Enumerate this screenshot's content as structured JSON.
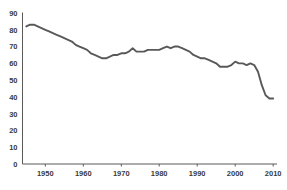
{
  "chart_data": {
    "type": "line",
    "title": "",
    "xlabel": "",
    "ylabel": "",
    "xlim": [
      1944,
      2011
    ],
    "ylim": [
      0,
      90
    ],
    "grid": false,
    "legend": null,
    "ytick_labels": [
      "90",
      "80",
      "70",
      "60",
      "50",
      "40",
      "30",
      "20",
      "10",
      "0"
    ],
    "yticks": [
      90,
      80,
      70,
      60,
      50,
      40,
      30,
      20,
      10,
      0
    ],
    "xtick_labels": [
      "1950",
      "1960",
      "1970",
      "1980",
      "1990",
      "2000",
      "2010"
    ],
    "xticks": [
      1950,
      1960,
      1970,
      1980,
      1990,
      2000,
      2010
    ],
    "series": [
      {
        "name": "series-1",
        "color": "#595959",
        "x": [
          1945,
          1946,
          1947,
          1948,
          1949,
          1950,
          1951,
          1952,
          1953,
          1954,
          1955,
          1956,
          1957,
          1958,
          1959,
          1960,
          1961,
          1962,
          1963,
          1964,
          1965,
          1966,
          1967,
          1968,
          1969,
          1970,
          1971,
          1972,
          1973,
          1974,
          1975,
          1976,
          1977,
          1978,
          1979,
          1980,
          1981,
          1982,
          1983,
          1984,
          1985,
          1986,
          1987,
          1988,
          1989,
          1990,
          1991,
          1992,
          1993,
          1994,
          1995,
          1996,
          1997,
          1998,
          1999,
          2000,
          2001,
          2002,
          2003,
          2004,
          2005,
          2006,
          2007,
          2008,
          2009,
          2010
        ],
        "values": [
          82,
          83,
          83,
          82,
          81,
          80,
          79,
          78,
          77,
          76,
          75,
          74,
          73,
          71,
          70,
          69,
          68,
          66,
          65,
          64,
          63,
          63,
          64,
          65,
          65,
          66,
          66,
          67,
          69,
          67,
          67,
          67,
          68,
          68,
          68,
          68,
          69,
          70,
          69,
          70,
          70,
          69,
          68,
          67,
          65,
          64,
          63,
          63,
          62,
          61,
          60,
          58,
          58,
          58,
          59,
          61,
          60,
          60,
          59,
          60,
          59,
          55,
          47,
          41,
          39,
          39
        ]
      }
    ]
  }
}
